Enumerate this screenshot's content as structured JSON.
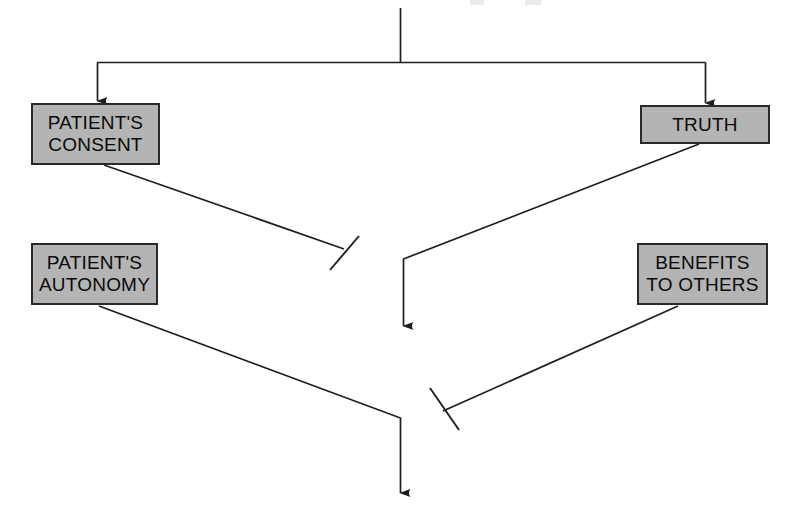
{
  "diagram": {
    "canvas": {
      "width": 797,
      "height": 526
    },
    "palette": {
      "box_fill": "#b4b4b4",
      "box_border": "#2a2a2a",
      "line": "#1e1e1e",
      "text": "#0a0a0a",
      "background": "#ffffff"
    },
    "nodes": [
      {
        "id": "patients-consent",
        "lines": [
          "PATIENT'S",
          "CONSENT"
        ],
        "line1": "PATIENT'S",
        "line2": "CONSENT"
      },
      {
        "id": "truth",
        "lines": [
          "TRUTH"
        ],
        "line1": "TRUTH",
        "line2": ""
      },
      {
        "id": "patients-autonomy",
        "lines": [
          "PATIENT'S",
          "AUTONOMY"
        ],
        "line1": "PATIENT'S",
        "line2": "AUTONOMY"
      },
      {
        "id": "benefits-to-others",
        "lines": [
          "BENEFITS",
          "TO OTHERS"
        ],
        "line1": "BENEFITS",
        "line2": "TO OTHERS"
      }
    ],
    "connectors": [
      {
        "id": "root-stem",
        "kind": "plain-line",
        "from": "top-edge",
        "to": "distribution-bar",
        "label": ""
      },
      {
        "id": "distribution-bar",
        "kind": "plain-line",
        "from": "root-stem",
        "to": "both-top-nodes",
        "label": ""
      },
      {
        "id": "branch-to-patients-consent",
        "kind": "arrow",
        "from": "distribution-bar",
        "to": "patients-consent",
        "label": ""
      },
      {
        "id": "branch-to-truth",
        "kind": "arrow",
        "from": "distribution-bar",
        "to": "truth",
        "label": ""
      },
      {
        "id": "consent-inhibits",
        "kind": "inhibition",
        "from": "patients-consent",
        "to": "truth-outflow",
        "label": ""
      },
      {
        "id": "truth-outflow",
        "kind": "arrow",
        "from": "truth",
        "to": "downstream",
        "label": ""
      },
      {
        "id": "autonomy-outflow",
        "kind": "arrow",
        "from": "patients-autonomy",
        "to": "downstream",
        "label": ""
      },
      {
        "id": "benefits-inhibits",
        "kind": "inhibition",
        "from": "benefits-to-others",
        "to": "autonomy-outflow",
        "label": ""
      }
    ]
  }
}
